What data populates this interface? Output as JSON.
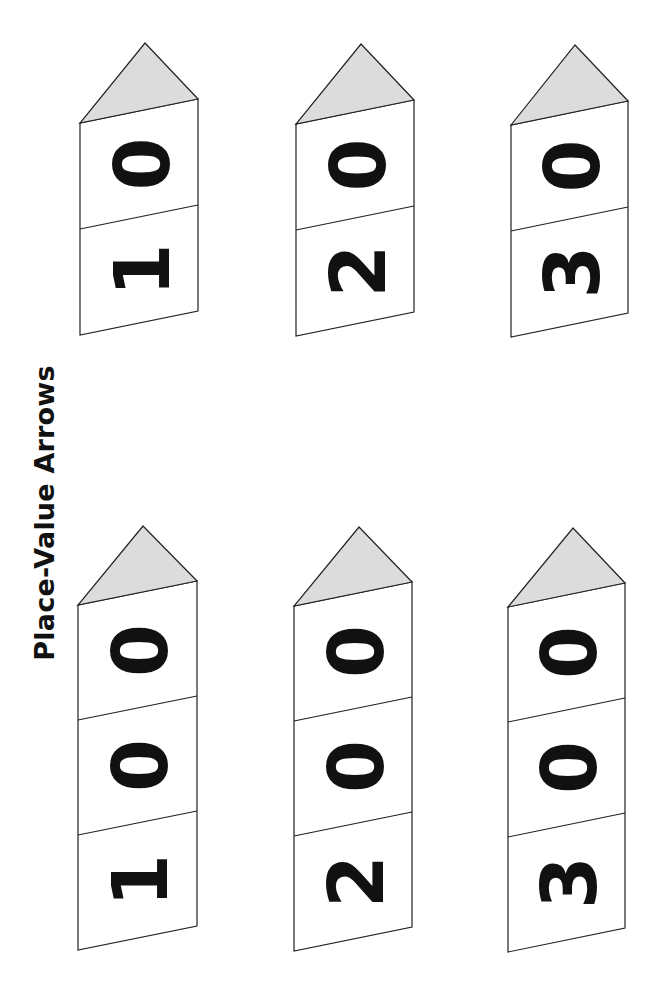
{
  "title": "Place-Value Arrows",
  "colors": {
    "outline": "#222222",
    "arrow_tip_fill": "#dcdcdc",
    "card_fill": "#ffffff",
    "digit": "#111111"
  },
  "arrows": [
    {
      "id": "arrow-10",
      "value": "10",
      "digits": [
        "1",
        "0"
      ],
      "apex": [
        145,
        43
      ],
      "left_x": 80,
      "right_x": 198,
      "left_top_y": 123,
      "right_top_y": 99,
      "section_height": 106
    },
    {
      "id": "arrow-20",
      "value": "20",
      "digits": [
        "2",
        "0"
      ],
      "apex": [
        361,
        44
      ],
      "left_x": 296,
      "right_x": 414,
      "left_top_y": 124,
      "right_top_y": 100,
      "section_height": 106
    },
    {
      "id": "arrow-30",
      "value": "30",
      "digits": [
        "3",
        "0"
      ],
      "apex": [
        575,
        45
      ],
      "left_x": 511,
      "right_x": 628,
      "left_top_y": 125,
      "right_top_y": 101,
      "section_height": 106
    },
    {
      "id": "arrow-100",
      "value": "100",
      "digits": [
        "1",
        "0",
        "0"
      ],
      "apex": [
        143,
        526
      ],
      "left_x": 78,
      "right_x": 197,
      "left_top_y": 605,
      "right_top_y": 581,
      "section_height": 115
    },
    {
      "id": "arrow-200",
      "value": "200",
      "digits": [
        "2",
        "0",
        "0"
      ],
      "apex": [
        359,
        527
      ],
      "left_x": 294,
      "right_x": 412,
      "left_top_y": 606,
      "right_top_y": 582,
      "section_height": 115
    },
    {
      "id": "arrow-300",
      "value": "300",
      "digits": [
        "3",
        "0",
        "0"
      ],
      "apex": [
        573,
        528
      ],
      "left_x": 508,
      "right_x": 625,
      "left_top_y": 607,
      "right_top_y": 583,
      "section_height": 115
    }
  ]
}
